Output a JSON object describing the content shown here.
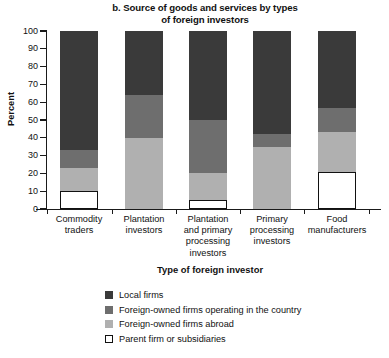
{
  "chart_data": {
    "type": "bar",
    "subtype": "stacked-bar-100",
    "title": "b. Source of goods and services by types of foreign investors",
    "title_lines": [
      "b. Source of goods and services by types",
      "of foreign investors"
    ],
    "xlabel": "Type of foreign investor",
    "ylabel": "Percent",
    "ylim": [
      0,
      100
    ],
    "yticks": [
      0,
      10,
      20,
      30,
      40,
      50,
      60,
      70,
      80,
      90,
      100
    ],
    "ytick_labels": [
      "0",
      "10",
      "20",
      "30",
      "40",
      "50",
      "60",
      "70",
      "80",
      "90",
      "100"
    ],
    "grid": false,
    "legend_position": "bottom",
    "categories": [
      "Commodity traders",
      "Plantation investors",
      "Plantation and primary processing investors",
      "Primary processing investors",
      "Food manufacturers"
    ],
    "category_label_lines": [
      [
        "Commodity",
        "traders"
      ],
      [
        "Plantation",
        "investors"
      ],
      [
        "Plantation",
        "and primary",
        "processing",
        "investors"
      ],
      [
        "Primary",
        "processing",
        "investors"
      ],
      [
        "Food",
        "manufacturers"
      ]
    ],
    "series": [
      {
        "name": "Local firms",
        "color": "#3a3a3a",
        "values": [
          67,
          36,
          50,
          58,
          43
        ]
      },
      {
        "name": "Foreign-owned firms operating in the country",
        "color": "#6e6e6e",
        "values": [
          10,
          24,
          30,
          7,
          14
        ]
      },
      {
        "name": "Foreign-owned firms abroad",
        "color": "#b0b0b0",
        "values": [
          13,
          40,
          15,
          35,
          22
        ]
      },
      {
        "name": "Parent firm or subsidiaries",
        "color": "#ffffff",
        "outline": true,
        "values": [
          10,
          0,
          5,
          0,
          21
        ]
      }
    ]
  },
  "legend": {
    "items": [
      {
        "label": "Local firms",
        "color": "#3a3a3a",
        "outline": false
      },
      {
        "label": "Foreign-owned firms operating in the country",
        "color": "#6e6e6e",
        "outline": false
      },
      {
        "label": "Foreign-owned firms abroad",
        "color": "#b0b0b0",
        "outline": false
      },
      {
        "label": "Parent firm or subsidiaries",
        "color": "#ffffff",
        "outline": true
      }
    ]
  }
}
